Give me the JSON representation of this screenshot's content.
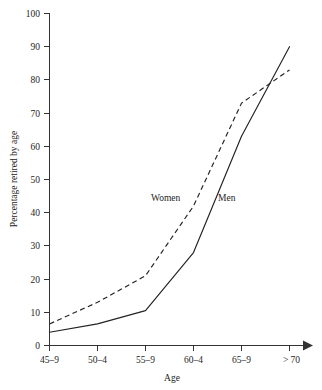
{
  "chart_data": {
    "type": "line",
    "title": "",
    "xlabel": "Age",
    "ylabel": "Percentage retired by age",
    "categories": [
      "45–9",
      "50–4",
      "55–9",
      "60–4",
      "65–9",
      "> 70"
    ],
    "ylim": [
      0,
      100
    ],
    "yticks": [
      0,
      10,
      20,
      30,
      40,
      50,
      60,
      70,
      80,
      90,
      100
    ],
    "ytick_labels": [
      "0",
      "10",
      "20",
      "30",
      "40",
      "50",
      "60",
      "70",
      "80",
      "90",
      "100"
    ],
    "grid": false,
    "legend": "inline-labels",
    "series": [
      {
        "name": "Women",
        "style": "dashed",
        "color": "#222222",
        "values": [
          6.5,
          13,
          21,
          42,
          73,
          83
        ],
        "label_text": "Women"
      },
      {
        "name": "Men",
        "style": "solid",
        "color": "#222222",
        "values": [
          4,
          6.5,
          10.5,
          28,
          63,
          90
        ],
        "label_text": "Men"
      }
    ],
    "annotations": [
      {
        "text": "Women",
        "series": "Women"
      },
      {
        "text": "Men",
        "series": "Men"
      }
    ],
    "axis_style": {
      "x_axis_arrow": true,
      "y_axis_arrow": false
    }
  },
  "axes": {
    "y_title": "Percentage retired by age",
    "x_title": "Age",
    "y_ticks": [
      "100",
      "90",
      "80",
      "70",
      "60",
      "50",
      "40",
      "30",
      "20",
      "10",
      "0"
    ],
    "x_ticks": [
      "45–9",
      "50–4",
      "55–9",
      "60–4",
      "65–9",
      "> 70"
    ]
  },
  "labels": {
    "women": "Women",
    "men": "Men"
  }
}
